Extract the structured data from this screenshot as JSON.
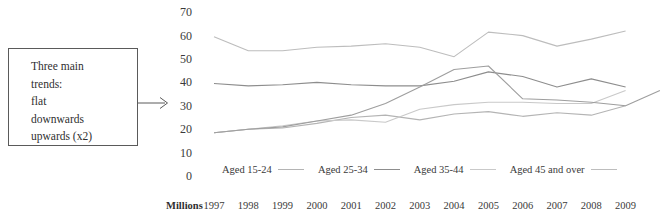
{
  "callout": {
    "text": "Three main\ntrends:\nflat\ndownwards\nupwards (x2)",
    "arrow_icon": "arrow-right-icon"
  },
  "chart_data": {
    "type": "line",
    "title": "",
    "xlabel": "",
    "ylabel": "",
    "units_label": "Millions",
    "grid": false,
    "legend_position": "bottom",
    "ylim": [
      0,
      70
    ],
    "yticks": [
      70,
      60,
      50,
      40,
      30,
      20,
      10,
      0
    ],
    "categories": [
      "1997",
      "1998",
      "1999",
      "2000",
      "2001",
      "2002",
      "2003",
      "2004",
      "2005",
      "2006",
      "2007",
      "2008",
      "2009"
    ],
    "series": [
      {
        "name": "Aged 15-24",
        "color": "#b4b4b4",
        "values": [
          18.5,
          20.0,
          20.5,
          22.5,
          25.0,
          26.0,
          24.0,
          26.5,
          27.5,
          25.5,
          27.0,
          26.0,
          30.0
        ]
      },
      {
        "name": "Aged 25-34",
        "color": "#8d8d8d",
        "values": [
          39.5,
          38.5,
          39.0,
          40.0,
          39.0,
          38.5,
          38.5,
          40.5,
          44.5,
          42.5,
          38.0,
          41.5,
          38.0
        ]
      },
      {
        "name": "Aged 35-44",
        "color": "#c9c9c9",
        "values": [
          18.5,
          20.0,
          21.5,
          23.5,
          24.0,
          23.0,
          28.5,
          30.5,
          31.5,
          31.5,
          31.0,
          31.0,
          36.5
        ]
      },
      {
        "name": "Aged 45 and over",
        "color": "#bdbdbd",
        "values": [
          59.5,
          53.5,
          53.5,
          55.0,
          55.5,
          56.5,
          55.0,
          51.0,
          61.5,
          60.0,
          55.5,
          58.5,
          62.0
        ]
      }
    ],
    "extra_series": [
      {
        "name": "Aged 15-24-upper",
        "color": "#9e9e9e",
        "values": [
          18.5,
          20.0,
          21.0,
          23.5,
          26.0,
          31.0,
          38.0,
          45.5,
          47.0,
          33.0,
          32.5,
          31.5,
          30.0,
          36.5
        ]
      }
    ]
  }
}
